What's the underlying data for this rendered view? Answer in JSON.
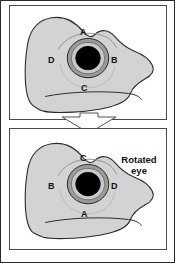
{
  "figure": {
    "background_color": "#ffffff",
    "border_color": "#2a2a2a",
    "panel_border_color": "#4a4a4a"
  },
  "colors": {
    "head_fill": "#d3d3d3",
    "head_outline": "#2b2b2b",
    "eye_outer_ring": "#9a9a9a",
    "eye_iris": "#c9c9c9",
    "eye_pupil": "#000000",
    "label_text": "#111111"
  },
  "panels": [
    {
      "id": "normal-eye",
      "name": "top-panel",
      "caption": "",
      "eye_labels": [
        {
          "id": "top",
          "text": "A",
          "x": 82,
          "y": 30
        },
        {
          "id": "right",
          "text": "B",
          "x": 110,
          "y": 58
        },
        {
          "id": "bottom",
          "text": "C",
          "x": 82,
          "y": 86
        },
        {
          "id": "left",
          "text": "D",
          "x": 52,
          "y": 58
        }
      ]
    },
    {
      "id": "rotated-eye",
      "name": "bottom-panel",
      "caption": "Rotated\neye",
      "caption_line1": "Rotated",
      "caption_line2": "eye",
      "eye_labels": [
        {
          "id": "top",
          "text": "C",
          "x": 82,
          "y": 157
        },
        {
          "id": "right",
          "text": "D",
          "x": 110,
          "y": 183
        },
        {
          "id": "bottom",
          "text": "A",
          "x": 82,
          "y": 211
        },
        {
          "id": "left",
          "text": "B",
          "x": 52,
          "y": 183
        }
      ]
    }
  ],
  "arrow": {
    "name": "downward-arrow",
    "direction": "down",
    "outline_color": "#555555",
    "fill_color": "#ffffff"
  }
}
